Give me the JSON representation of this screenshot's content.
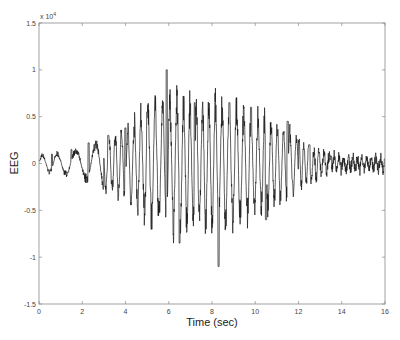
{
  "chart_data": {
    "type": "line",
    "title": "",
    "xlabel": "Time (sec)",
    "ylabel": "EEG",
    "y_multiplier_label": "x 10",
    "y_multiplier_exponent": "4",
    "xlim": [
      0,
      16
    ],
    "ylim": [
      -1.5,
      1.5
    ],
    "y_scale": 10000,
    "grid": false,
    "legend": null,
    "x_ticks": [
      0,
      2,
      4,
      6,
      8,
      10,
      12,
      14,
      16
    ],
    "x_tick_labels": [
      "0",
      "2",
      "4",
      "6",
      "8",
      "10",
      "12",
      "14",
      "16"
    ],
    "y_ticks": [
      1.5,
      1,
      0.5,
      0,
      -0.5,
      -1,
      -1.5
    ],
    "y_tick_labels": [
      "1.5",
      "1",
      "0.5",
      "0",
      "-0.5",
      "-1",
      "-1.5"
    ],
    "line_color": "#1a1a1a",
    "series": [
      {
        "name": "EEG",
        "description": "Seizure-like EEG burst: low amplitude 0-3 s, rising to large oscillations 5-11 s, decaying after 12 s to low-amplitude noise 13-16 s",
        "envelope": {
          "t": [
            0,
            1,
            2,
            3,
            4,
            5,
            6,
            7,
            8,
            9,
            10,
            11,
            12,
            13,
            14,
            15,
            16
          ],
          "amplitude": [
            0.08,
            0.1,
            0.15,
            0.25,
            0.35,
            0.55,
            0.65,
            0.6,
            0.62,
            0.6,
            0.5,
            0.4,
            0.25,
            0.12,
            0.06,
            0.06,
            0.07
          ]
        },
        "key_points": [
          {
            "t": 0.0,
            "value": 0.03
          },
          {
            "t": 0.6,
            "value": 0.1
          },
          {
            "t": 1.5,
            "value": 0.15
          },
          {
            "t": 2.3,
            "value": 0.22
          },
          {
            "t": 3.2,
            "value": 0.3
          },
          {
            "t": 4.0,
            "value": 0.38
          },
          {
            "t": 5.0,
            "value": 0.55
          },
          {
            "t": 5.9,
            "value": 1.0
          },
          {
            "t": 6.5,
            "value": -0.85
          },
          {
            "t": 7.2,
            "value": 0.65
          },
          {
            "t": 8.3,
            "value": -1.1
          },
          {
            "t": 8.8,
            "value": 0.65
          },
          {
            "t": 9.8,
            "value": 0.6
          },
          {
            "t": 10.5,
            "value": -0.6
          },
          {
            "t": 11.5,
            "value": 0.45
          },
          {
            "t": 12.5,
            "value": 0.2
          },
          {
            "t": 13.5,
            "value": 0.08
          },
          {
            "t": 16.0,
            "value": 0.05
          }
        ],
        "max": {
          "t": 5.9,
          "value": 1.0
        },
        "min": {
          "t": 8.3,
          "value": -1.1
        }
      }
    ]
  }
}
